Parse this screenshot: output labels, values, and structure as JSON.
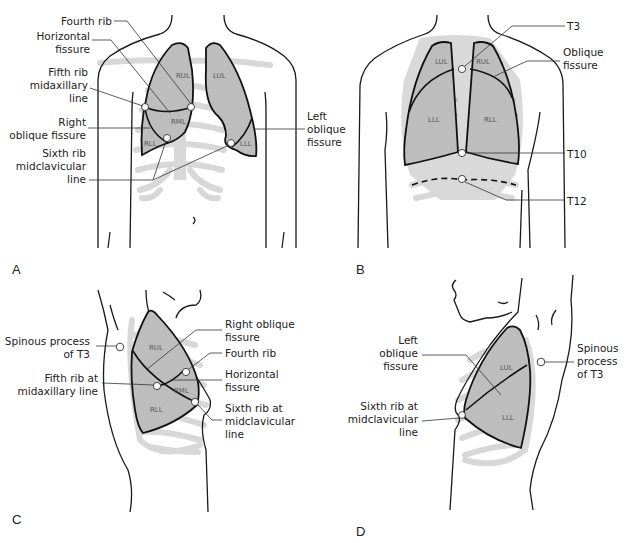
{
  "figure": {
    "panels": [
      {
        "id": "A",
        "label": "A",
        "view": "anterior",
        "lobes": [
          "RUL",
          "LUL",
          "RML",
          "RLL",
          "LLL"
        ],
        "callouts": [
          {
            "text_lines": [
              "Fourth rib"
            ]
          },
          {
            "text_lines": [
              "Horizontal",
              "fissure"
            ]
          },
          {
            "text_lines": [
              "Fifth rib",
              "midaxillary",
              "line"
            ]
          },
          {
            "text_lines": [
              "Right",
              "oblique fissure"
            ]
          },
          {
            "text_lines": [
              "Sixth rib",
              "midclavicular",
              "line"
            ]
          },
          {
            "text_lines": [
              "Left",
              "oblique",
              "fissure"
            ]
          }
        ]
      },
      {
        "id": "B",
        "label": "B",
        "view": "posterior",
        "lobes": [
          "LUL",
          "RUL",
          "LLL",
          "RLL"
        ],
        "callouts": [
          {
            "text_lines": [
              "T3"
            ]
          },
          {
            "text_lines": [
              "Oblique",
              "fissure"
            ]
          },
          {
            "text_lines": [
              "T10"
            ]
          },
          {
            "text_lines": [
              "T12"
            ]
          }
        ]
      },
      {
        "id": "C",
        "label": "C",
        "view": "right lateral",
        "lobes": [
          "RUL",
          "RML",
          "RLL"
        ],
        "callouts": [
          {
            "text_lines": [
              "Spinous process",
              "of T3"
            ]
          },
          {
            "text_lines": [
              "Fifth rib at",
              "midaxillary line"
            ]
          },
          {
            "text_lines": [
              "Right oblique",
              "fissure"
            ]
          },
          {
            "text_lines": [
              "Fourth rib"
            ]
          },
          {
            "text_lines": [
              "Horizontal",
              "fissure"
            ]
          },
          {
            "text_lines": [
              "Sixth rib at",
              "midclavicular",
              "line"
            ]
          }
        ]
      },
      {
        "id": "D",
        "label": "D",
        "view": "left lateral",
        "lobes": [
          "LUL",
          "LLL"
        ],
        "callouts": [
          {
            "text_lines": [
              "Left",
              "oblique",
              "fissure"
            ]
          },
          {
            "text_lines": [
              "Sixth rib at",
              "midclavicular",
              "line"
            ]
          },
          {
            "text_lines": [
              "Spinous",
              "process",
              "of T3"
            ]
          }
        ]
      }
    ],
    "colors": {
      "lung_fill": "#bdbdbd",
      "rib_fill": "#d8d8d8",
      "outline": "#111111"
    }
  }
}
